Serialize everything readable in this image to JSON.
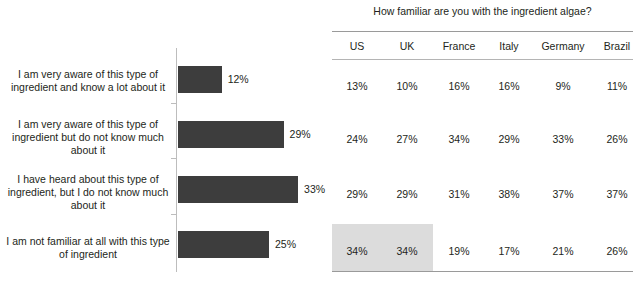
{
  "chart_data": {
    "type": "bar",
    "orientation": "horizontal",
    "title": "",
    "xlabel": "",
    "ylabel": "",
    "categories": [
      "I am very aware of this type of ingredient and know a lot about it",
      "I am very aware of this type of ingredient but do not know much about it",
      "I have heard about this type of ingredient, but I do not know much about it",
      "I am not familiar at all with this type of ingredient"
    ],
    "values": [
      12,
      29,
      33,
      25
    ],
    "value_labels": [
      "12%",
      "29%",
      "33%",
      "25%"
    ],
    "bar_color": "#3d3d3d",
    "axis_color": "#bdbdbd",
    "grid": false,
    "legend": "none",
    "xlim": [
      0,
      40
    ]
  },
  "table": {
    "title": "How familiar are you with the ingredient algae?",
    "columns": [
      "US",
      "UK",
      "France",
      "Italy",
      "Germany",
      "Brazil"
    ],
    "rows": [
      {
        "values": [
          "13%",
          "10%",
          "16%",
          "16%",
          "9%",
          "11%"
        ]
      },
      {
        "values": [
          "24%",
          "27%",
          "34%",
          "29%",
          "33%",
          "26%"
        ]
      },
      {
        "values": [
          "29%",
          "29%",
          "31%",
          "38%",
          "37%",
          "37%"
        ]
      },
      {
        "values": [
          "34%",
          "34%",
          "19%",
          "17%",
          "21%",
          "26%"
        ]
      }
    ],
    "highlight": {
      "row_index": 3,
      "columns": [
        "US",
        "UK"
      ],
      "color": "#dcdcdc"
    },
    "rule_color": "#9a9a9a"
  }
}
